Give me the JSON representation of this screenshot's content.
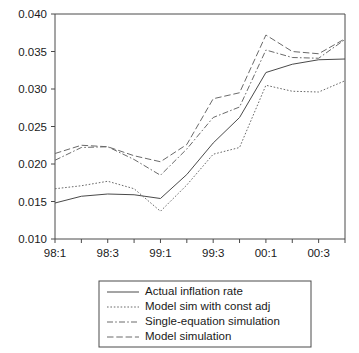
{
  "chart_data": {
    "type": "line",
    "title": "",
    "subtitle": "",
    "xlabel": "",
    "ylabel": "",
    "xlim": [
      "98:1",
      "00:4"
    ],
    "ylim": [
      0.01,
      0.04
    ],
    "grid": false,
    "legend_position": "bottom-center",
    "x": [
      "98:1",
      "98:2",
      "98:3",
      "98:4",
      "99:1",
      "99:2",
      "99:3",
      "99:4",
      "00:1",
      "00:2",
      "00:3",
      "00:4"
    ],
    "x_tick_labels": [
      "98:1",
      "98:3",
      "99:1",
      "99:3",
      "00:1",
      "00:3"
    ],
    "y_tick_labels": [
      "0.010",
      "0.015",
      "0.020",
      "0.025",
      "0.030",
      "0.035",
      "0.040"
    ],
    "y_ticks": [
      0.01,
      0.015,
      0.02,
      0.025,
      0.03,
      0.035,
      0.04
    ],
    "series": [
      {
        "name": "Actual inflation rate",
        "style": "solid",
        "color": "#4a4a4a",
        "values": [
          0.0148,
          0.0157,
          0.016,
          0.0159,
          0.0154,
          0.0186,
          0.0228,
          0.0262,
          0.0322,
          0.0333,
          0.0339,
          0.034
        ]
      },
      {
        "name": "Model sim with const adj",
        "style": "dotted",
        "color": "#6a6a6a",
        "values": [
          0.0167,
          0.0171,
          0.0177,
          0.0167,
          0.0137,
          0.0172,
          0.0213,
          0.0222,
          0.0305,
          0.0297,
          0.0296,
          0.0311
        ]
      },
      {
        "name": "Single-equation simulation",
        "style": "dash-dot",
        "color": "#6a6a6a",
        "values": [
          0.0205,
          0.0222,
          0.0223,
          0.0206,
          0.0185,
          0.022,
          0.0262,
          0.0276,
          0.0352,
          0.0342,
          0.0341,
          0.0366
        ]
      },
      {
        "name": "Model simulation",
        "style": "long-dash",
        "color": "#6a6a6a",
        "values": [
          0.0214,
          0.0225,
          0.0223,
          0.0211,
          0.0203,
          0.0226,
          0.0287,
          0.0295,
          0.0372,
          0.035,
          0.0347,
          0.0367
        ]
      }
    ]
  },
  "legend": {
    "entries": [
      {
        "label": "Actual inflation rate"
      },
      {
        "label": "Model sim with const adj"
      },
      {
        "label": "Single-equation simulation"
      },
      {
        "label": "Model simulation"
      }
    ]
  }
}
